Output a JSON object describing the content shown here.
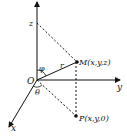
{
  "diagram": {
    "axes": {
      "x": {
        "label": "x"
      },
      "y": {
        "label": "y"
      },
      "z": {
        "label": ""
      }
    },
    "points": {
      "origin": {
        "label": "O"
      },
      "z_mark": {
        "label": "z"
      },
      "M": {
        "label": "M(x,y,z)"
      },
      "P": {
        "label": "P(x,y,0)"
      }
    },
    "annotations": {
      "radius": "r",
      "phi": "φ",
      "theta": "θ"
    },
    "colors": {
      "line": "#111111",
      "background": "#ffffff"
    }
  }
}
